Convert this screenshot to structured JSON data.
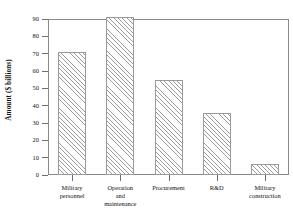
{
  "chart_data": {
    "type": "bar",
    "title": "",
    "xlabel": "",
    "ylabel": "Amount ($ billions)",
    "categories": [
      "Military\npersonnel",
      "Operation\nand\nmaintenance",
      "Procurement",
      "R&D",
      "Military\nconstruction"
    ],
    "values": [
      71,
      91,
      55,
      36,
      6.5
    ],
    "ylim": [
      0,
      90
    ],
    "yticks": [
      0,
      10,
      20,
      30,
      40,
      50,
      60,
      70,
      80,
      90
    ],
    "ytick_labels": [
      "0",
      "10",
      "20",
      "30",
      "40",
      "50",
      "60",
      "70",
      "80",
      "90"
    ],
    "grid": false,
    "legend": "none",
    "bar_fill": "diagonal-hatch",
    "bar_color": "#9b9b9b",
    "frame_color": "#8a8a8a",
    "background": "#ffffff"
  }
}
